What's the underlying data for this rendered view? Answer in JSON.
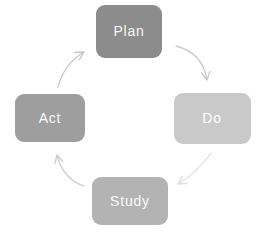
{
  "diagram": {
    "name": "PDSA cycle",
    "background_color": "#ffffff",
    "direction": "clockwise",
    "nodes": [
      {
        "id": "plan",
        "label": "Plan",
        "fill": "#8c8c8c",
        "text_color": "#f7f7f7",
        "position": "top"
      },
      {
        "id": "do",
        "label": "Do",
        "fill": "#c9c9c9",
        "text_color": "#ffffff",
        "position": "right"
      },
      {
        "id": "study",
        "label": "Study",
        "fill": "#b3b3b3",
        "text_color": "#fcfcfc",
        "position": "bottom"
      },
      {
        "id": "act",
        "label": "Act",
        "fill": "#9e9e9e",
        "text_color": "#fafafa",
        "position": "left"
      }
    ],
    "arrows": [
      {
        "from": "Plan",
        "to": "Do",
        "color": "#c9c9c9"
      },
      {
        "from": "Do",
        "to": "Study",
        "color": "#dfdfdf"
      },
      {
        "from": "Study",
        "to": "Act",
        "color": "#cfcfcf"
      },
      {
        "from": "Act",
        "to": "Plan",
        "color": "#c6c6c6"
      }
    ]
  }
}
